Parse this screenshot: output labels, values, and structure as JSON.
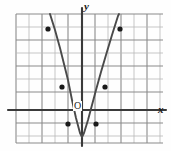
{
  "figure": {
    "kind": "coordinate-grid-parabola-graph",
    "background_color": "#fefefe",
    "width": 171,
    "height": 151
  },
  "labels": {
    "y_axis": "y",
    "x_axis": "x",
    "origin": "O"
  },
  "colors": {
    "grid": "#8a8a8a",
    "grid_light": "#b9b9b9",
    "axis": "#3a3a3a",
    "curve": "#4a4a4a",
    "point": "#1a1a1a"
  },
  "chart_data": {
    "type": "line",
    "title": "",
    "xlabel": "x",
    "ylabel": "y",
    "grid": true,
    "legend": null,
    "axes": {
      "origin_px": [
        82,
        110
      ],
      "cell_px": 13,
      "x_axis_y_px": 110,
      "y_axis_x_px": 82,
      "xlim_px": [
        16,
        163
      ],
      "ylim_px": [
        14,
        143
      ]
    },
    "gridlines": {
      "vertical_x_px": [
        16,
        29,
        42,
        55,
        68,
        82,
        95,
        108,
        121,
        134,
        147,
        160
      ],
      "horizontal_y_px": [
        14,
        27,
        40,
        53,
        66,
        79,
        92,
        110,
        123,
        136,
        143
      ]
    },
    "curve": {
      "name": "parabola",
      "shape": "upward-opening parabola",
      "vertex_px": [
        82,
        137
      ],
      "path_px": [
        [
          50,
          14
        ],
        [
          55,
          30
        ],
        [
          60,
          48
        ],
        [
          64,
          64
        ],
        [
          68,
          80
        ],
        [
          72,
          100
        ],
        [
          76,
          118
        ],
        [
          80,
          133
        ],
        [
          82,
          137
        ],
        [
          84,
          133
        ],
        [
          88,
          120
        ],
        [
          92,
          105
        ],
        [
          96,
          90
        ],
        [
          101,
          72
        ],
        [
          106,
          55
        ],
        [
          112,
          35
        ],
        [
          118,
          16
        ],
        [
          119,
          14
        ]
      ]
    },
    "points_px": [
      [
        48,
        29
      ],
      [
        120,
        29
      ],
      [
        62,
        87
      ],
      [
        105,
        87
      ],
      [
        68,
        124
      ],
      [
        96,
        124
      ]
    ],
    "point_count": 6
  }
}
